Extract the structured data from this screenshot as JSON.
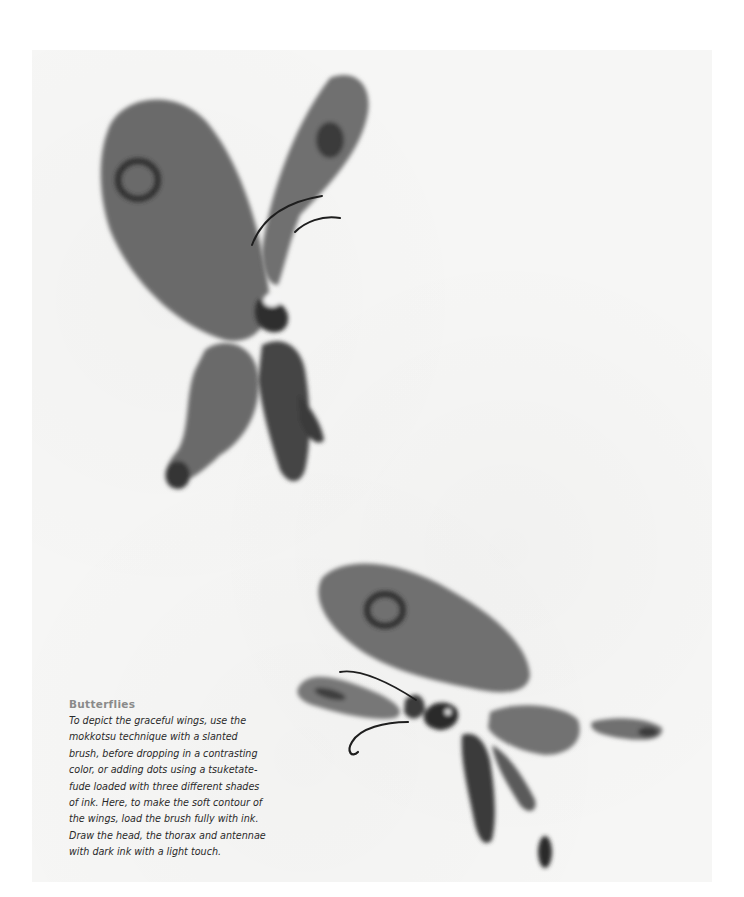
{
  "page": {
    "background_color": "#ffffff",
    "paper_color": "#f6f6f5",
    "ink_color": "#5a5a5a",
    "dark_ink_color": "#1e1e1e"
  },
  "illustrations": [
    {
      "name": "butterfly-top",
      "description": "Ink-wash butterfly with wings raised, viewed from above-left"
    },
    {
      "name": "butterfly-bottom",
      "description": "Ink-wash butterfly with wings spread, viewed from the side"
    }
  ],
  "caption": {
    "title": "Butterflies",
    "lines": [
      "To depict the graceful wings, use the",
      "mokkotsu technique with a slanted",
      "brush, before dropping in a contrasting",
      "color, or adding dots using a tsuketate-",
      "fude loaded with three different shades",
      "of ink. Here, to make the soft contour of",
      "the wings, load the brush fully with ink.",
      "Draw the head, the thorax and antennae",
      "with dark ink with a light touch."
    ],
    "body": "To depict the graceful wings, use the\nmokkotsu technique with a slanted\nbrush, before dropping in a contrasting\ncolor, or adding dots using a tsuketate-\nfude loaded with three different shades\nof ink. Here, to make the soft contour of\nthe wings, load the brush fully with ink.\nDraw the head, the thorax and antennae\nwith dark ink with a light touch."
  }
}
